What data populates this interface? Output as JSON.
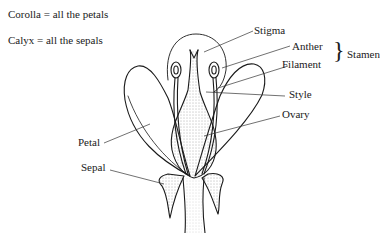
{
  "diagram": {
    "legend": [
      {
        "text": "Corolla = all the petals"
      },
      {
        "text": "Calyx = all the sepals"
      }
    ],
    "labels": {
      "stigma": "Stigma",
      "anther": "Anther",
      "filament": "Filament",
      "stamen": "Stamen",
      "style": "Style",
      "ovary": "Ovary",
      "petal": "Petal",
      "sepal": "Sepal"
    },
    "brace": "}",
    "colors": {
      "line": "#1a1a1a",
      "background": "#ffffff",
      "stipple": "#555555"
    }
  }
}
